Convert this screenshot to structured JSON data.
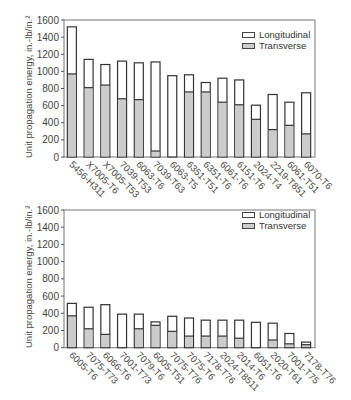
{
  "chart_data": [
    {
      "type": "bar",
      "stacked": false,
      "overlaid": true,
      "title": "",
      "xlabel": "",
      "ylabel": "Unit propagation energy, in.-lb/in.²",
      "ylim": [
        0,
        1600
      ],
      "yticks": [
        0,
        200,
        400,
        600,
        800,
        1000,
        1200,
        1400,
        1600
      ],
      "grid": false,
      "legend_position": "upper right",
      "categories": [
        "5456-H311",
        "X7005-T6",
        "X7005-T53",
        "7039-T53",
        "6063-T6",
        "7039-T63",
        "6063-T5",
        "6351-T51",
        "6351-T6",
        "6061-T6",
        "6151-T6",
        "2024-T4",
        "2219-T851",
        "6061-T51",
        "6070-T6"
      ],
      "series": [
        {
          "name": "Longitudinal",
          "color": "#ffffff",
          "values": [
            1520,
            1140,
            1080,
            1120,
            1100,
            1110,
            950,
            960,
            870,
            920,
            900,
            605,
            730,
            640,
            750
          ]
        },
        {
          "name": "Transverse",
          "color": "#cccccc",
          "values": [
            970,
            810,
            840,
            680,
            670,
            70,
            0,
            760,
            760,
            640,
            610,
            440,
            320,
            370,
            270
          ]
        }
      ]
    },
    {
      "type": "bar",
      "stacked": false,
      "overlaid": true,
      "title": "",
      "xlabel": "",
      "ylabel": "Unit propagation energy, in.-lb/in.²",
      "ylim": [
        0,
        1600
      ],
      "yticks": [
        0,
        200,
        400,
        600,
        800,
        1000,
        1200,
        1400,
        1600
      ],
      "grid": false,
      "legend_position": "upper right",
      "categories": [
        "6005-T6",
        "7075-T73",
        "6066-T6",
        "7001-T73",
        "7079-T6",
        "6005-T51",
        "7075-T76",
        "7075-T6",
        "7178-T76",
        "2024-T8511",
        "2014-T6",
        "6051-T6",
        "2020-T61",
        "7001-T75",
        "7178-T76"
      ],
      "series": [
        {
          "name": "Longitudinal",
          "color": "#ffffff",
          "values": [
            515,
            470,
            500,
            390,
            390,
            300,
            365,
            345,
            320,
            320,
            320,
            295,
            285,
            165,
            65
          ]
        },
        {
          "name": "Transverse",
          "color": "#cccccc",
          "values": [
            370,
            220,
            155,
            0,
            220,
            260,
            190,
            135,
            135,
            135,
            110,
            0,
            90,
            45,
            35
          ]
        }
      ]
    }
  ],
  "legend": {
    "longitudinal": "Longitudinal",
    "transverse": "Transverse"
  },
  "ylabel": "Unit propagation energy, in.-lb/in.²"
}
